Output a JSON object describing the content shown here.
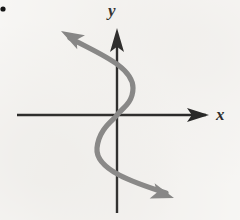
{
  "figure": {
    "kind": "coordinate-plane-curve",
    "background_color": "#f8f7f5",
    "bullet": {
      "name": "item-bullet",
      "shape": "filled-circle",
      "color": "#121212",
      "cx": 3.0,
      "cy": 9.0,
      "r": 2.6
    },
    "axes": {
      "color": "#151515",
      "stroke_width": 2.4,
      "x_axis": {
        "label": "x",
        "label_x": 216,
        "label_y": 106,
        "start": [
          17,
          115
        ],
        "end": [
          206,
          115
        ],
        "arrow_at": "end",
        "arrow_tip": [
          209,
          115
        ],
        "arrow_half_width": 7,
        "arrow_length": 22
      },
      "y_axis": {
        "label": "y",
        "label_x": 108,
        "label_y": 2,
        "start": [
          117,
          213
        ],
        "end": [
          31,
          115
        ],
        "arrow_at": "top",
        "arrow_tip": [
          117,
          28
        ],
        "arrow_half_width": 7,
        "arrow_length": 24,
        "x_position": 117
      },
      "origin": [
        117,
        115
      ]
    },
    "curve": {
      "name": "cubic-s-curve",
      "color": "#7d7d7d",
      "stroke_width": 5.2,
      "description": "sideways S-shaped curve through the origin, arrowheads at both ends",
      "path": "M 70 38 C 95 52, 133 66, 133 88 C 133 104, 120 110, 117 115 C 114 120, 99 128, 97 148 C 95 170, 135 183, 166 193",
      "start_point": [
        70,
        38
      ],
      "end_point": [
        166,
        193
      ],
      "passes_through_origin": true,
      "right_extreme": [
        133,
        88
      ],
      "left_extreme": [
        97,
        148
      ],
      "arrow_start": {
        "tip": [
          61,
          31
        ],
        "angle_deg": 209,
        "half_width": 8,
        "length": 23
      },
      "arrow_end": {
        "tip": [
          174,
          198
        ],
        "angle_deg": 18,
        "half_width": 8,
        "length": 23
      }
    }
  }
}
